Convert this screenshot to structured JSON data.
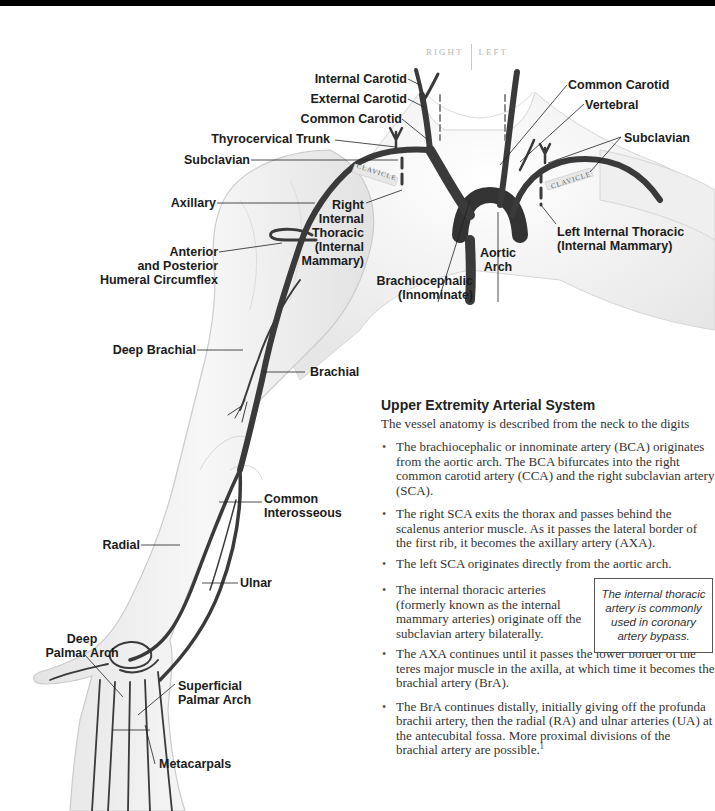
{
  "orientation": {
    "right": "RIGHT",
    "left": "LEFT"
  },
  "clavicle_label": "CLAVICLE",
  "labels": {
    "internal_carotid": "Internal Carotid",
    "external_carotid": "External Carotid",
    "common_carotid_right": "Common Carotid",
    "thyrocervical_trunk": "Thyrocervical Trunk",
    "subclavian_right": "Subclavian",
    "axillary": "Axillary",
    "humeral_circumflex": [
      "Anterior",
      "and Posterior",
      "Humeral Circumflex"
    ],
    "right_internal_thoracic": [
      "Right",
      "Internal",
      "Thoracic",
      "(Internal",
      "Mammary)"
    ],
    "brachiocephalic": [
      "Brachiocephalic",
      "(Innominate)"
    ],
    "aortic_arch": [
      "Aortic",
      "Arch"
    ],
    "common_carotid_left": "Common Carotid",
    "vertebral": "Vertebral",
    "subclavian_left": "Subclavian",
    "left_internal_thoracic": [
      "Left Internal Thoracic",
      "(Internal Mammary)"
    ],
    "deep_brachial": "Deep Brachial",
    "brachial": "Brachial",
    "common_interosseous": [
      "Common",
      "Interosseous"
    ],
    "radial": "Radial",
    "ulnar": "Ulnar",
    "deep_palmar_arch": [
      "Deep",
      "Palmar Arch"
    ],
    "superficial_palmar_arch": [
      "Superficial",
      "Palmar Arch"
    ],
    "metacarpals": "Metacarpals"
  },
  "panel": {
    "title": "Upper Extremity Arterial System",
    "intro": "The vessel anatomy is described from the neck to the digits",
    "bullets": [
      "The brachiocephalic or innominate artery (BCA) originates from the aortic arch. The BCA bifurcates into the right common carotid artery (CCA) and the right subclavian artery (SCA).",
      "The right SCA exits the thorax and passes behind the scalenus anterior muscle. As it passes the lateral border of the first rib, it becomes the axillary artery (AXA).",
      "The left SCA originates directly from the aortic arch.",
      "The internal thoracic arteries (formerly known as the internal mammary arteries) originate off the subclavian artery bilaterally.",
      "The AXA continues until it passes the lower border of the teres major muscle in the axilla, at which time it becomes the brachial artery (BrA).",
      "The BrA continues distally, initially giving off the profunda brachii artery, then the radial (RA) and ulnar arteries (UA) at the antecubital fossa. More proximal divisions of the brachial artery are possible."
    ],
    "footnote_marker": "1"
  },
  "callout": "The internal thoracic artery is commonly used in coronary artery bypass.",
  "colors": {
    "artery": "#3a3a3a",
    "skin_fill": "#f1f1f1",
    "skin_outline": "#c8c8c8",
    "text": "#1c1c1c",
    "callout_border": "#555555"
  }
}
